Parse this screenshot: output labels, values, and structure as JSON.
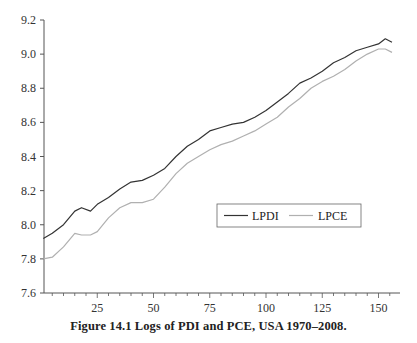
{
  "chart_data": {
    "type": "line",
    "title": "",
    "caption": "Figure 14.1   Logs of PDI and PCE, USA 1970–2008.",
    "xlabel": "",
    "ylabel": "",
    "xlim": [
      0,
      157
    ],
    "ylim": [
      7.6,
      9.2
    ],
    "x_ticks": [
      25,
      50,
      75,
      100,
      125,
      150
    ],
    "y_ticks": [
      7.6,
      7.8,
      8.0,
      8.2,
      8.4,
      8.6,
      8.8,
      9.0,
      9.2
    ],
    "y_tick_labels": [
      "7.6",
      "7.8",
      "8.0",
      "8.2",
      "8.4",
      "8.6",
      "8.8",
      "9.0",
      "9.2"
    ],
    "grid": false,
    "legend_position": "center-right inside plot",
    "x": [
      1,
      5,
      10,
      15,
      18,
      22,
      25,
      30,
      35,
      40,
      45,
      50,
      55,
      60,
      65,
      70,
      75,
      80,
      85,
      90,
      95,
      100,
      105,
      110,
      115,
      120,
      125,
      130,
      135,
      140,
      145,
      150,
      153,
      156
    ],
    "series": [
      {
        "name": "LPDI",
        "color": "#333333",
        "values": [
          7.92,
          7.95,
          8.0,
          8.08,
          8.1,
          8.08,
          8.12,
          8.16,
          8.21,
          8.25,
          8.26,
          8.29,
          8.33,
          8.4,
          8.46,
          8.5,
          8.55,
          8.57,
          8.59,
          8.6,
          8.63,
          8.67,
          8.72,
          8.77,
          8.83,
          8.86,
          8.9,
          8.95,
          8.98,
          9.02,
          9.04,
          9.06,
          9.09,
          9.07
        ]
      },
      {
        "name": "LPCE",
        "color": "#b0b0b0",
        "values": [
          7.8,
          7.81,
          7.87,
          7.95,
          7.94,
          7.94,
          7.96,
          8.04,
          8.1,
          8.13,
          8.13,
          8.15,
          8.22,
          8.3,
          8.36,
          8.4,
          8.44,
          8.47,
          8.49,
          8.52,
          8.55,
          8.59,
          8.63,
          8.69,
          8.74,
          8.8,
          8.84,
          8.87,
          8.91,
          8.96,
          9.0,
          9.03,
          9.03,
          9.01
        ]
      }
    ]
  },
  "legend": {
    "items": [
      {
        "label": "LPDI",
        "color": "#333333"
      },
      {
        "label": "LPCE",
        "color": "#b0b0b0"
      }
    ]
  }
}
